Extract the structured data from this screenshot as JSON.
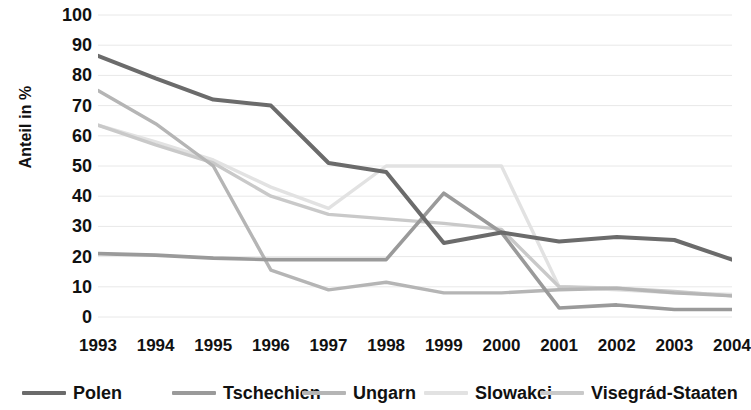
{
  "chart_data": {
    "type": "line",
    "title": "",
    "subtitle": "",
    "xlabel": "",
    "ylabel": "Anteil in %",
    "categories": [
      "1993",
      "1994",
      "1995",
      "1996",
      "1997",
      "1998",
      "1999",
      "2000",
      "2001",
      "2002",
      "2003",
      "2004"
    ],
    "x": [
      1993,
      1994,
      1995,
      1996,
      1997,
      1998,
      1999,
      2000,
      2001,
      2002,
      2003,
      2004
    ],
    "ylim": [
      0,
      100
    ],
    "xlim": [
      1993,
      2004
    ],
    "yticks": [
      0,
      10,
      20,
      30,
      40,
      50,
      60,
      70,
      80,
      90,
      100
    ],
    "ytick_labels": [
      "0",
      "10",
      "20",
      "30",
      "40",
      "50",
      "60",
      "70",
      "80",
      "90",
      "100"
    ],
    "grid": true,
    "grid_axis": "y",
    "legend_position": "bottom",
    "series": [
      {
        "name": "Polen",
        "color": "#6b6b6b",
        "width": 4.0,
        "values": [
          86.5,
          79,
          72,
          70,
          51,
          48,
          24.5,
          28,
          25,
          26.5,
          25.5,
          19
        ]
      },
      {
        "name": "Tschechien",
        "color": "#9a9a9a",
        "width": 3.6,
        "values": [
          21,
          20.5,
          19.5,
          19,
          19,
          19,
          41,
          28,
          3,
          4,
          2.5,
          2.5
        ]
      },
      {
        "name": "Ungarn",
        "color": "#b5b5b5",
        "width": 3.4,
        "values": [
          75,
          64,
          50,
          15.5,
          9,
          11.5,
          8,
          8,
          9,
          9.5,
          8,
          7
        ]
      },
      {
        "name": "Slowakei",
        "color": "#e2e2e2",
        "width": 3.4,
        "values": [
          63.5,
          58,
          52,
          43,
          36,
          50,
          50,
          50,
          10,
          9,
          8,
          7.5
        ]
      },
      {
        "name": "Visegrád-Staaten",
        "color": "#c9c9c9",
        "width": 3.4,
        "values": [
          63.5,
          57,
          51,
          40,
          34,
          32.5,
          31,
          29,
          10,
          9.5,
          8.5,
          7
        ]
      }
    ]
  },
  "axis": {
    "y_label": "Anteil in %"
  },
  "legend": {
    "items": [
      {
        "label": "Polen"
      },
      {
        "label": "Tschechien"
      },
      {
        "label": "Ungarn"
      },
      {
        "label": "Slowakei"
      },
      {
        "label": "Visegrád-Staaten"
      }
    ]
  },
  "colors": {
    "grid": "#e8e8e8",
    "background": "#ffffff",
    "text": "#111111"
  }
}
